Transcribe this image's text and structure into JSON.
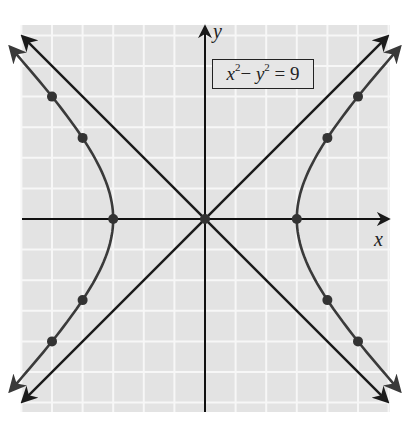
{
  "chart_data": {
    "type": "line",
    "title": "",
    "equation_label": {
      "lhs_a": "x",
      "lhs_b": "y",
      "exp": "2",
      "minus": "−",
      "eq": "= 9",
      "full": "x^2 − y^2 = 9"
    },
    "xlabel": "x",
    "ylabel": "y",
    "xlim": [
      -6,
      6
    ],
    "ylim": [
      -6.3,
      6.3
    ],
    "grid": true,
    "grid_step": 1,
    "series": [
      {
        "name": "hyperbola right branch",
        "kind": "curve",
        "equation": "x = sqrt(9 + y^2)",
        "y_range": [
          -5.6,
          5.6
        ]
      },
      {
        "name": "hyperbola left branch",
        "kind": "curve",
        "equation": "x = -sqrt(9 + y^2)",
        "y_range": [
          -5.6,
          5.6
        ]
      },
      {
        "name": "asymptote y = x",
        "kind": "line",
        "points": [
          [
            -5.95,
            -5.95
          ],
          [
            5.95,
            5.95
          ]
        ]
      },
      {
        "name": "asymptote y = -x",
        "kind": "line",
        "points": [
          [
            -5.95,
            5.95
          ],
          [
            5.95,
            -5.95
          ]
        ]
      }
    ],
    "points": [
      {
        "x": 0,
        "y": 0
      },
      {
        "x": 3,
        "y": 0
      },
      {
        "x": -3,
        "y": 0
      },
      {
        "x": 4,
        "y": 2.65
      },
      {
        "x": 4,
        "y": -2.65
      },
      {
        "x": -4,
        "y": 2.65
      },
      {
        "x": -4,
        "y": -2.65
      },
      {
        "x": 5,
        "y": 4
      },
      {
        "x": 5,
        "y": -4
      },
      {
        "x": -5,
        "y": 4
      },
      {
        "x": -5,
        "y": -4
      }
    ],
    "colors": {
      "grid_bg": "#e3e3e3",
      "grid_line": "#f7f7f7",
      "axis": "#111111",
      "curve": "#3a3a3a",
      "asymptote": "#1a1a1a",
      "point": "#333333"
    }
  }
}
